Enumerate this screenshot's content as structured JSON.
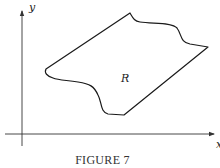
{
  "figure": {
    "caption": "FIGURE 7",
    "x_axis_label": "x",
    "y_axis_label": "y",
    "region_label": "R",
    "colors": {
      "line": "#1a1a1a",
      "axis": "#333333",
      "text": "#222222",
      "background": "#ffffff"
    }
  }
}
